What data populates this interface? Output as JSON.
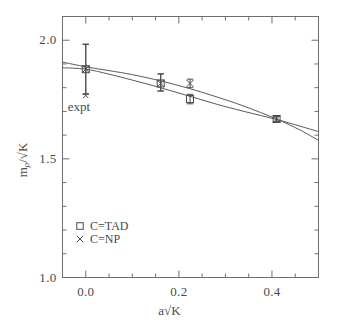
{
  "chart_data": {
    "type": "scatter",
    "title": "",
    "xlabel": "a√K",
    "ylabel": "m_ρ/√K",
    "xlim": [
      -0.05,
      0.5
    ],
    "ylim": [
      1.0,
      2.1
    ],
    "grid": false,
    "legend_position": "lower-left",
    "xticks": [
      0.0,
      0.2,
      0.4
    ],
    "xtick_labels": [
      "0.0",
      "0.2",
      "0.4"
    ],
    "yticks": [
      1.0,
      1.5,
      2.0
    ],
    "ytick_labels": [
      "1.0",
      "1.5",
      "2.0"
    ],
    "x_minor_tick_step": 0.05,
    "y_minor_tick_step": 0.1,
    "series": [
      {
        "name": "C=TAD",
        "marker": "square",
        "legend_label": "C=TAD",
        "points": [
          {
            "x": 0.0,
            "y": 1.878,
            "yerr_low": 0.105,
            "yerr_high": 0.105
          },
          {
            "x": 0.161,
            "y": 1.818,
            "yerr_low": 0.032,
            "yerr_high": 0.04
          },
          {
            "x": 0.224,
            "y": 1.752,
            "yerr_low": 0.02,
            "yerr_high": 0.02
          },
          {
            "x": 0.41,
            "y": 1.668,
            "yerr_low": 0.012,
            "yerr_high": 0.012
          }
        ]
      },
      {
        "name": "C=NP",
        "marker": "cross",
        "legend_label": "C=NP",
        "points": [
          {
            "x": 0.0,
            "y": 1.878,
            "yerr_low": 0.105,
            "yerr_high": 0.105
          },
          {
            "x": 0.161,
            "y": 1.818,
            "yerr_low": 0.032,
            "yerr_high": 0.04
          },
          {
            "x": 0.224,
            "y": 1.818,
            "yerr_low": 0.018,
            "yerr_high": 0.018
          },
          {
            "x": 0.41,
            "y": 1.668,
            "yerr_low": 0.012,
            "yerr_high": 0.012
          }
        ]
      }
    ],
    "fit_curves": [
      {
        "name": "fit-tad",
        "points": [
          {
            "x": -0.05,
            "y": 1.884
          },
          {
            "x": 0.0,
            "y": 1.878
          },
          {
            "x": 0.05,
            "y": 1.857
          },
          {
            "x": 0.1,
            "y": 1.832
          },
          {
            "x": 0.16,
            "y": 1.8
          },
          {
            "x": 0.22,
            "y": 1.766
          },
          {
            "x": 0.28,
            "y": 1.731
          },
          {
            "x": 0.34,
            "y": 1.7
          },
          {
            "x": 0.41,
            "y": 1.666
          },
          {
            "x": 0.46,
            "y": 1.638
          },
          {
            "x": 0.5,
            "y": 1.615
          }
        ]
      },
      {
        "name": "fit-np",
        "points": [
          {
            "x": -0.05,
            "y": 1.908
          },
          {
            "x": 0.0,
            "y": 1.888
          },
          {
            "x": 0.05,
            "y": 1.872
          },
          {
            "x": 0.1,
            "y": 1.855
          },
          {
            "x": 0.16,
            "y": 1.829
          },
          {
            "x": 0.22,
            "y": 1.798
          },
          {
            "x": 0.28,
            "y": 1.762
          },
          {
            "x": 0.34,
            "y": 1.722
          },
          {
            "x": 0.41,
            "y": 1.668
          },
          {
            "x": 0.46,
            "y": 1.622
          },
          {
            "x": 0.5,
            "y": 1.578
          }
        ]
      }
    ],
    "annotations": [
      {
        "name": "expt",
        "label": "expt",
        "marker": "cross",
        "x": 0.0,
        "y": 1.767,
        "label_y": 1.718
      }
    ]
  },
  "axes": {
    "x_title": "a√K",
    "y_title_numerator": "m",
    "y_title_subscript": "ρ",
    "y_title_denominator": "√K"
  },
  "legend": {
    "entries": [
      {
        "marker": "square",
        "label": "C=TAD"
      },
      {
        "marker": "cross",
        "label": "C=NP"
      }
    ]
  },
  "style": {
    "line_color": "#5a5a5a",
    "marker_color": "#4a4a4a",
    "axis_color": "#6e6e6e",
    "text_color": "#4a4a4a",
    "background": "#ffffff"
  }
}
